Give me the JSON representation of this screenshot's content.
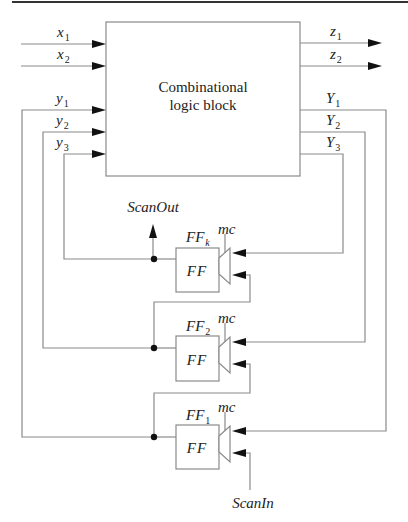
{
  "diagram": {
    "block": {
      "line1": "Combinational",
      "line2": "logic block"
    },
    "inputs": [
      {
        "base": "x",
        "sub": "1"
      },
      {
        "base": "x",
        "sub": "2"
      }
    ],
    "outputs": [
      {
        "base": "z",
        "sub": "1"
      },
      {
        "base": "z",
        "sub": "2"
      }
    ],
    "state_inputs": [
      {
        "base": "y",
        "sub": "1"
      },
      {
        "base": "y",
        "sub": "2"
      },
      {
        "base": "y",
        "sub": "3"
      }
    ],
    "next_state": [
      {
        "base": "Y",
        "sub": "1"
      },
      {
        "base": "Y",
        "sub": "2"
      },
      {
        "base": "Y",
        "sub": "3"
      }
    ],
    "flipflops": [
      {
        "name_base": "FF",
        "name_sub": "k",
        "body": "FF",
        "mux_control": "mc"
      },
      {
        "name_base": "FF",
        "name_sub": "2",
        "body": "FF",
        "mux_control": "mc"
      },
      {
        "name_base": "FF",
        "name_sub": "1",
        "body": "FF",
        "mux_control": "mc"
      }
    ],
    "scan_out": "ScanOut",
    "scan_in": "ScanIn"
  }
}
